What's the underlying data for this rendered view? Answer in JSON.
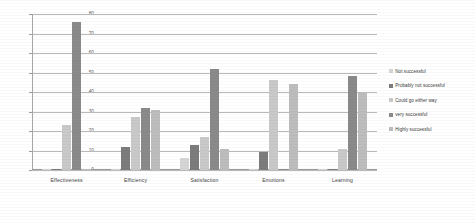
{
  "chart_data": {
    "type": "bar",
    "title": "",
    "xlabel": "",
    "ylabel": "",
    "ylim": [
      0,
      80
    ],
    "ytick_values": [
      80,
      70,
      60,
      50,
      40,
      30,
      20,
      10,
      0
    ],
    "grid": true,
    "legend_position": "right",
    "categories": [
      "Effectiveness",
      "Efficiency",
      "Satisfaction",
      "Emotions",
      "Learning"
    ],
    "series": [
      {
        "name": "Not successful",
        "color": "#d5d5d5",
        "values": [
          0,
          0,
          6,
          0,
          0
        ]
      },
      {
        "name": "Probably not successful",
        "color": "#7c7c7c",
        "values": [
          0,
          12,
          13,
          9,
          0
        ]
      },
      {
        "name": "Could go either way",
        "color": "#c9c9c9",
        "values": [
          23,
          27,
          17,
          46,
          11
        ]
      },
      {
        "name": "very successful",
        "color": "#8a8a8a",
        "values": [
          76,
          32,
          52,
          0,
          48
        ]
      },
      {
        "name": "Highly successful",
        "color": "#bdbdbd",
        "values": [
          0,
          31,
          11,
          44,
          40
        ]
      }
    ]
  },
  "legend": {
    "items": [
      {
        "label": "Not successful",
        "color": "#d5d5d5"
      },
      {
        "label": "Probably not successful",
        "color": "#7c7c7c"
      },
      {
        "label": "Could go either way",
        "color": "#c9c9c9"
      },
      {
        "label": "very successful",
        "color": "#8a8a8a"
      },
      {
        "label": "Highly successful",
        "color": "#bdbdbd"
      }
    ]
  }
}
